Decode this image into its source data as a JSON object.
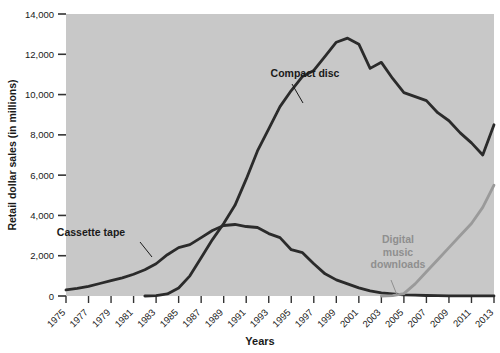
{
  "chart_data": {
    "type": "line",
    "title": "",
    "xlabel": "Years",
    "ylabel": "Retail dollar sales (in millions)",
    "xlim": [
      1975,
      2013
    ],
    "ylim": [
      0,
      14000
    ],
    "grid": false,
    "legend_position": "inline-annotations",
    "plot_background": "#c8c8c8",
    "x": [
      1975,
      1976,
      1977,
      1978,
      1979,
      1980,
      1981,
      1982,
      1983,
      1984,
      1985,
      1986,
      1987,
      1988,
      1989,
      1990,
      1991,
      1992,
      1993,
      1994,
      1995,
      1996,
      1997,
      1998,
      1999,
      2000,
      2001,
      2002,
      2003,
      2004,
      2005,
      2006,
      2007,
      2008,
      2009,
      2010,
      2011,
      2012,
      2013
    ],
    "xtick_labels": [
      "1975",
      "1977",
      "1979",
      "1981",
      "1983",
      "1985",
      "1987",
      "1989",
      "1991",
      "1993",
      "1995",
      "1997",
      "1999",
      "2001",
      "2003",
      "2005",
      "2007",
      "2009",
      "2011",
      "2013"
    ],
    "ytick_labels": [
      "0",
      "2,000",
      "4,000",
      "6,000",
      "8,000",
      "10,000",
      "12,000",
      "14,000"
    ],
    "ytick_values": [
      0,
      2000,
      4000,
      6000,
      8000,
      10000,
      12000,
      14000
    ],
    "series": [
      {
        "name": "Cassette tape",
        "color": "#2b2b2b",
        "label_color": "#1a1a1a",
        "values": [
          300,
          380,
          480,
          620,
          760,
          900,
          1080,
          1300,
          1600,
          2050,
          2400,
          2550,
          2900,
          3250,
          3500,
          3550,
          3450,
          3400,
          3100,
          2900,
          2300,
          2150,
          1600,
          1100,
          800,
          600,
          400,
          250,
          150,
          100,
          60,
          40,
          25,
          15,
          10,
          8,
          5,
          3,
          2
        ]
      },
      {
        "name": "Compact disc",
        "color": "#2b2b2b",
        "label_color": "#1a1a1a",
        "values": [
          0,
          0,
          0,
          0,
          0,
          0,
          0,
          0,
          20,
          100,
          400,
          1000,
          1900,
          2800,
          3600,
          4500,
          5800,
          7200,
          8300,
          9400,
          10200,
          10900,
          11200,
          11900,
          12600,
          12800,
          12500,
          11300,
          11600,
          10800,
          10100,
          9900,
          9700,
          9100,
          8700,
          8100,
          7600,
          7000,
          8500
        ]
      },
      {
        "name": "Digital music downloads",
        "color": "#9a9a9a",
        "label_color": "#8f8f8f",
        "values": [
          0,
          0,
          0,
          0,
          0,
          0,
          0,
          0,
          0,
          0,
          0,
          0,
          0,
          0,
          0,
          0,
          0,
          0,
          0,
          0,
          0,
          0,
          0,
          0,
          0,
          0,
          0,
          0,
          0,
          20,
          120,
          600,
          1200,
          1800,
          2400,
          3000,
          3600,
          4400,
          5500
        ]
      }
    ],
    "annotations": [
      {
        "id": "compact-disc-annotation",
        "text": "Compact disc",
        "x": 305,
        "y": 77,
        "color": "#1a1a1a",
        "leader": {
          "x1": 292,
          "y1": 84,
          "x2": 303,
          "y2": 103
        }
      },
      {
        "id": "cassette-tape-annotation",
        "text": "Cassette tape",
        "x": 91,
        "y": 236,
        "color": "#1a1a1a",
        "leader": {
          "x1": 140,
          "y1": 242,
          "x2": 152,
          "y2": 257
        }
      },
      {
        "id": "digital-downloads-annotation",
        "lines": [
          "Digital",
          "music",
          "downloads"
        ],
        "x": 398,
        "y": 243,
        "color": "#8f8f8f",
        "leader": {
          "x1": 391,
          "y1": 280,
          "x2": 397,
          "y2": 295
        }
      }
    ]
  }
}
